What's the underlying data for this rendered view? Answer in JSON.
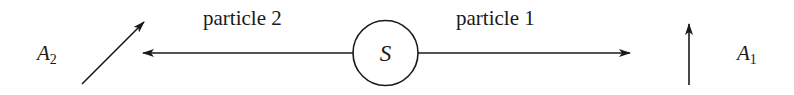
{
  "diagram": {
    "source": {
      "label": "S"
    },
    "particles": [
      {
        "id": "particle-1",
        "label": "particle 1",
        "direction": "right"
      },
      {
        "id": "particle-2",
        "label": "particle 2",
        "direction": "left"
      }
    ],
    "analyzers": [
      {
        "id": "A1",
        "base": "A",
        "subscript": "1",
        "orientation": "vertical"
      },
      {
        "id": "A2",
        "base": "A",
        "subscript": "2",
        "orientation": "diagonal-45"
      }
    ],
    "colors": {
      "stroke": "#1a1a1a",
      "background": "#ffffff"
    }
  }
}
